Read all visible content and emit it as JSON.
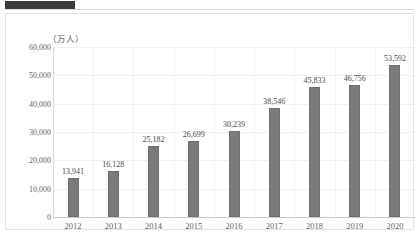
{
  "header": {
    "redaction_label": ""
  },
  "chart_data": {
    "type": "bar",
    "title": "",
    "xlabel": "",
    "ylabel": "（万人）",
    "unit_caption": "（万人）",
    "categories": [
      "2012",
      "2013",
      "2014",
      "2015",
      "2016",
      "2017",
      "2018",
      "2019",
      "2020"
    ],
    "values": [
      13941,
      16128,
      25182,
      26699,
      30239,
      38546,
      45833,
      46756,
      53592
    ],
    "value_labels": [
      "13,941",
      "16,128",
      "25,182",
      "26,699",
      "30,239",
      "38,546",
      "45,833",
      "46,756",
      "53,592"
    ],
    "ylim": [
      0,
      60000
    ],
    "ytick_values": [
      0,
      10000,
      20000,
      30000,
      40000,
      50000,
      60000
    ],
    "ytick_labels": [
      "0",
      "10,000",
      "20,000",
      "30,000",
      "40,000",
      "50,000",
      "60,000"
    ],
    "grid": true,
    "legend": "none",
    "series": [
      {
        "name": "",
        "values": [
          13941,
          16128,
          25182,
          26699,
          30239,
          38546,
          45833,
          46756,
          53592
        ]
      }
    ],
    "colors": {
      "bar_fill": "#7b7b7b",
      "bar_stroke": "#6f6f6f",
      "gridline": "#efefef",
      "axis": "#c9c9c9",
      "text": "#5f5f5f"
    }
  }
}
